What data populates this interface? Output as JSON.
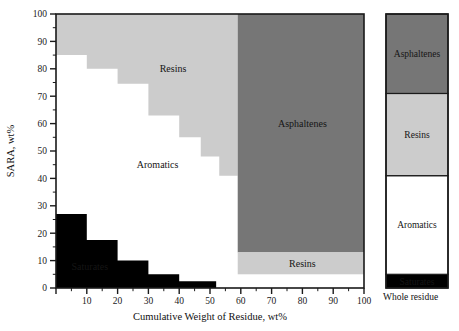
{
  "figure": {
    "background": "#ffffff",
    "plot": {
      "x": 56,
      "y": 14,
      "width": 308,
      "height": 274
    }
  },
  "chart_data": {
    "type": "area",
    "title": "",
    "xlabel": "Cumulative Weight of Residue, wt%",
    "ylabel": "SARA, wt%",
    "xlim": [
      0,
      100
    ],
    "ylim": [
      0,
      100
    ],
    "xticks": [
      0,
      10,
      20,
      30,
      40,
      50,
      60,
      70,
      80,
      90,
      100
    ],
    "xtick_labels": [
      "",
      "10",
      "20",
      "30",
      "40",
      "50",
      "60",
      "70",
      "80",
      "90",
      "100"
    ],
    "yticks": [
      0,
      10,
      20,
      30,
      40,
      50,
      60,
      70,
      80,
      90,
      100
    ],
    "ytick_labels": [
      "0",
      "10",
      "20",
      "30",
      "40",
      "50",
      "60",
      "70",
      "80",
      "90",
      "100"
    ],
    "minor_tick_step": 5,
    "grid": false,
    "legend": "none",
    "colors": {
      "saturates": "#000000",
      "aromatics": "#ffffff",
      "resins": "#cccccc",
      "asphaltenes": "#767676",
      "frame": "#1a1a1a"
    },
    "series": [
      {
        "name": "Saturates",
        "fill": "#000000",
        "label": "Saturates",
        "label_at": {
          "x": 11,
          "y": 8
        },
        "label_color": "#ffffff",
        "steps": [
          {
            "x0": 0,
            "x1": 10,
            "y": 27.0
          },
          {
            "x0": 10,
            "x1": 20,
            "y": 17.5
          },
          {
            "x0": 20,
            "x1": 30,
            "y": 10.0
          },
          {
            "x0": 30,
            "x1": 40,
            "y": 5.0
          },
          {
            "x0": 40,
            "x1": 52,
            "y": 2.5
          }
        ]
      },
      {
        "name": "Aromatics",
        "fill": "#ffffff",
        "label": "Aromatics",
        "label_at": {
          "x": 33,
          "y": 45
        },
        "label_color": "#151515"
      },
      {
        "name": "Resins",
        "fill": "#cccccc",
        "label": "Resins",
        "label_at": {
          "x": 38,
          "y": 80
        },
        "label_color": "#151515",
        "steps": [
          {
            "x0": 0,
            "x1": 10,
            "y": 85.0
          },
          {
            "x0": 10,
            "x1": 20,
            "y": 80.0
          },
          {
            "x0": 20,
            "x1": 30,
            "y": 74.5
          },
          {
            "x0": 30,
            "x1": 40,
            "y": 63.0
          },
          {
            "x0": 40,
            "x1": 47,
            "y": 55.0
          },
          {
            "x0": 47,
            "x1": 53,
            "y": 48.0
          },
          {
            "x0": 53,
            "x1": 59,
            "y": 41.0
          }
        ],
        "band": {
          "name": "Resins band",
          "label": "Resins",
          "x0": 59,
          "x1": 100,
          "y0": 5.0,
          "y1": 13.0,
          "label_at": {
            "x": 80,
            "y": 9
          }
        }
      },
      {
        "name": "Asphaltenes",
        "fill": "#767676",
        "label": "Asphaltenes",
        "label_at": {
          "x": 80,
          "y": 60
        },
        "label_color": "#151515",
        "block": {
          "x0": 59,
          "x1": 100,
          "y0": 13.0,
          "y1": 100.0
        }
      }
    ],
    "sidebar_bar": {
      "caption": "Whole residue",
      "x": 386,
      "y": 14,
      "width": 62,
      "height": 274,
      "segments": [
        {
          "name": "Saturates",
          "label": "Saturates",
          "from": 0,
          "to": 5,
          "fill": "#000000",
          "label_color": "#ffffff"
        },
        {
          "name": "Aromatics",
          "label": "Aromatics",
          "from": 5,
          "to": 41,
          "fill": "#ffffff",
          "label_color": "#151515"
        },
        {
          "name": "Resins",
          "label": "Resins",
          "from": 41,
          "to": 71,
          "fill": "#cccccc",
          "label_color": "#151515"
        },
        {
          "name": "Asphaltenes",
          "label": "Asphaltenes",
          "from": 71,
          "to": 100,
          "fill": "#767676",
          "label_color": "#151515"
        }
      ]
    }
  }
}
